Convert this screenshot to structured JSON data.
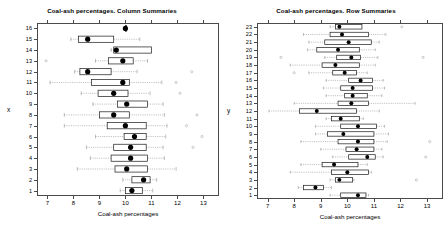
{
  "figure": {
    "width": 448,
    "height": 230,
    "background": "#ffffff",
    "foreground": "#000000",
    "box_stroke": "#1a1a1a",
    "whisker_stroke": "#8a8a8a",
    "median_fill": "#000000"
  },
  "panels": [
    {
      "name": "column-summaries",
      "title": "Coal-ash percentages. Column Summaries",
      "xlabel": "Coal-ash percentages",
      "ylabel": "x"
    },
    {
      "name": "row-summaries",
      "title": "Coal-ash percentages. Row Summaries",
      "xlabel": "Coal-ash percentages",
      "ylabel": "y"
    }
  ],
  "chart_data": [
    {
      "type": "box",
      "name": "column-summaries",
      "title": "Coal-ash percentages. Column Summaries",
      "xlabel": "Coal-ash percentages",
      "ylabel": "x",
      "orientation": "horizontal",
      "xlim": [
        6.6,
        13.6
      ],
      "xticks": [
        7,
        8,
        9,
        10,
        11,
        12,
        13
      ],
      "xticklabels": [
        "7",
        "8",
        "9",
        "10",
        "11",
        "12",
        "13"
      ],
      "categories": [
        1,
        2,
        3,
        4,
        5,
        6,
        7,
        8,
        9,
        10,
        11,
        12,
        13,
        14,
        15,
        16
      ],
      "grid": false,
      "legend": null,
      "boxes": [
        {
          "group": 16,
          "whisker_low": 10.0,
          "q1": 10.0,
          "median": 10.0,
          "q3": 10.0,
          "whisker_high": 10.0,
          "outliers": []
        },
        {
          "group": 15,
          "whisker_low": 7.9,
          "q1": 8.2,
          "median": 8.55,
          "q3": 9.55,
          "whisker_high": 10.55,
          "outliers": []
        },
        {
          "group": 14,
          "whisker_low": 9.45,
          "q1": 9.55,
          "median": 9.65,
          "q3": 11.0,
          "whisker_high": 11.0,
          "outliers": []
        },
        {
          "group": 13,
          "whisker_low": 8.85,
          "q1": 9.35,
          "median": 9.9,
          "q3": 10.3,
          "whisker_high": 10.85,
          "outliers": [
            6.95
          ]
        },
        {
          "group": 12,
          "whisker_low": 8.05,
          "q1": 8.25,
          "median": 8.55,
          "q3": 9.45,
          "whisker_high": 10.45,
          "outliers": [
            12.55
          ]
        },
        {
          "group": 11,
          "whisker_low": 7.1,
          "q1": 8.7,
          "median": 9.9,
          "q3": 10.15,
          "whisker_high": 11.4,
          "outliers": [
            11.95
          ]
        },
        {
          "group": 10,
          "whisker_low": 8.3,
          "q1": 8.95,
          "median": 9.55,
          "q3": 10.1,
          "whisker_high": 10.95,
          "outliers": [
            12.1
          ]
        },
        {
          "group": 9,
          "whisker_low": 8.75,
          "q1": 9.7,
          "median": 10.05,
          "q3": 10.85,
          "whisker_high": 11.45,
          "outliers": []
        },
        {
          "group": 8,
          "whisker_low": 7.65,
          "q1": 9.0,
          "median": 9.55,
          "q3": 10.15,
          "whisker_high": 11.5,
          "outliers": [
            12.75
          ]
        },
        {
          "group": 7,
          "whisker_low": 7.65,
          "q1": 9.3,
          "median": 10.0,
          "q3": 10.8,
          "whisker_high": 11.6,
          "outliers": [
            12.35
          ]
        },
        {
          "group": 6,
          "whisker_low": 8.85,
          "q1": 9.95,
          "median": 10.35,
          "q3": 10.8,
          "whisker_high": 11.55,
          "outliers": [
            12.95
          ]
        },
        {
          "group": 5,
          "whisker_low": 8.5,
          "q1": 9.55,
          "median": 10.2,
          "q3": 10.8,
          "whisker_high": 11.45,
          "outliers": [
            12.6
          ]
        },
        {
          "group": 4,
          "whisker_low": 8.65,
          "q1": 9.45,
          "median": 10.2,
          "q3": 10.85,
          "whisker_high": 11.5,
          "outliers": []
        },
        {
          "group": 3,
          "whisker_low": 8.15,
          "q1": 9.6,
          "median": 10.05,
          "q3": 10.85,
          "whisker_high": 11.95,
          "outliers": []
        },
        {
          "group": 2,
          "whisker_low": 9.9,
          "q1": 10.25,
          "median": 10.7,
          "q3": 10.95,
          "whisker_high": 11.2,
          "outliers": []
        },
        {
          "group": 1,
          "whisker_low": 9.8,
          "q1": 10.0,
          "median": 10.25,
          "q3": 10.65,
          "whisker_high": 11.05,
          "outliers": []
        }
      ]
    },
    {
      "type": "box",
      "name": "row-summaries",
      "title": "Coal-ash percentages. Row Summaries",
      "xlabel": "Coal-ash percentages",
      "ylabel": "y",
      "orientation": "horizontal",
      "xlim": [
        6.6,
        13.6
      ],
      "xticks": [
        7,
        8,
        9,
        10,
        11,
        12,
        13
      ],
      "xticklabels": [
        "7",
        "8",
        "9",
        "10",
        "11",
        "12",
        "13"
      ],
      "categories": [
        1,
        2,
        3,
        4,
        5,
        6,
        7,
        8,
        9,
        10,
        11,
        12,
        13,
        14,
        15,
        16,
        17,
        18,
        19,
        20,
        21,
        22,
        23
      ],
      "grid": false,
      "legend": null,
      "boxes": [
        {
          "group": 23,
          "whisker_low": 9.35,
          "q1": 9.55,
          "median": 9.7,
          "q3": 10.55,
          "whisker_high": 10.55,
          "outliers": [
            12.05
          ]
        },
        {
          "group": 22,
          "whisker_low": 8.35,
          "q1": 9.35,
          "median": 9.8,
          "q3": 10.8,
          "whisker_high": 11.45,
          "outliers": []
        },
        {
          "group": 21,
          "whisker_low": 8.55,
          "q1": 9.15,
          "median": 10.05,
          "q3": 10.9,
          "whisker_high": 11.2,
          "outliers": []
        },
        {
          "group": 20,
          "whisker_low": 8.5,
          "q1": 8.85,
          "median": 9.65,
          "q3": 10.45,
          "whisker_high": 11.05,
          "outliers": []
        },
        {
          "group": 19,
          "whisker_low": 9.15,
          "q1": 9.6,
          "median": 10.15,
          "q3": 10.5,
          "whisker_high": 11.15,
          "outliers": [
            7.5,
            12.85
          ]
        },
        {
          "group": 18,
          "whisker_low": 7.85,
          "q1": 9.05,
          "median": 9.55,
          "q3": 10.45,
          "whisker_high": 11.05,
          "outliers": []
        },
        {
          "group": 17,
          "whisker_low": 8.55,
          "q1": 9.45,
          "median": 9.9,
          "q3": 10.35,
          "whisker_high": 10.75,
          "outliers": [
            8.0
          ]
        },
        {
          "group": 16,
          "whisker_low": 9.2,
          "q1": 10.05,
          "median": 10.5,
          "q3": 10.95,
          "whisker_high": 11.35,
          "outliers": []
        },
        {
          "group": 15,
          "whisker_low": 9.1,
          "q1": 9.75,
          "median": 10.2,
          "q3": 10.95,
          "whisker_high": 11.4,
          "outliers": []
        },
        {
          "group": 14,
          "whisker_low": 9.2,
          "q1": 9.9,
          "median": 10.2,
          "q3": 10.75,
          "whisker_high": 11.3,
          "outliers": []
        },
        {
          "group": 13,
          "whisker_low": 8.0,
          "q1": 9.65,
          "median": 10.15,
          "q3": 10.8,
          "whisker_high": 12.55,
          "outliers": []
        },
        {
          "group": 12,
          "whisker_low": 7.05,
          "q1": 8.2,
          "median": 8.85,
          "q3": 10.35,
          "whisker_high": 11.2,
          "outliers": []
        },
        {
          "group": 11,
          "whisker_low": 9.2,
          "q1": 9.4,
          "median": 9.75,
          "q3": 10.45,
          "whisker_high": 10.6,
          "outliers": []
        },
        {
          "group": 10,
          "whisker_low": 8.8,
          "q1": 9.75,
          "median": 10.4,
          "q3": 11.1,
          "whisker_high": 11.4,
          "outliers": []
        },
        {
          "group": 9,
          "whisker_low": 8.8,
          "q1": 9.25,
          "median": 9.85,
          "q3": 11.0,
          "whisker_high": 11.55,
          "outliers": []
        },
        {
          "group": 8,
          "whisker_low": 8.25,
          "q1": 9.65,
          "median": 10.4,
          "q3": 11.0,
          "whisker_high": 11.5,
          "outliers": [
            13.1
          ]
        },
        {
          "group": 7,
          "whisker_low": 9.0,
          "q1": 9.95,
          "median": 10.35,
          "q3": 11.0,
          "whisker_high": 11.3,
          "outliers": []
        },
        {
          "group": 6,
          "whisker_low": 9.45,
          "q1": 10.05,
          "median": 10.75,
          "q3": 11.05,
          "whisker_high": 11.35,
          "outliers": [
            12.95
          ]
        },
        {
          "group": 5,
          "whisker_low": 8.25,
          "q1": 9.05,
          "median": 9.5,
          "q3": 10.4,
          "whisker_high": 10.75,
          "outliers": []
        },
        {
          "group": 4,
          "whisker_low": 7.85,
          "q1": 9.4,
          "median": 10.0,
          "q3": 10.8,
          "whisker_high": 10.9,
          "outliers": []
        },
        {
          "group": 3,
          "whisker_low": 9.35,
          "q1": 9.55,
          "median": 9.7,
          "q3": 10.2,
          "whisker_high": 10.25,
          "outliers": [
            12.6
          ]
        },
        {
          "group": 2,
          "whisker_low": 8.15,
          "q1": 8.35,
          "median": 8.8,
          "q3": 9.1,
          "whisker_high": 9.4,
          "outliers": []
        },
        {
          "group": 1,
          "whisker_low": 9.35,
          "q1": 9.75,
          "median": 10.4,
          "q3": 10.7,
          "whisker_high": 10.8,
          "outliers": []
        }
      ]
    }
  ]
}
